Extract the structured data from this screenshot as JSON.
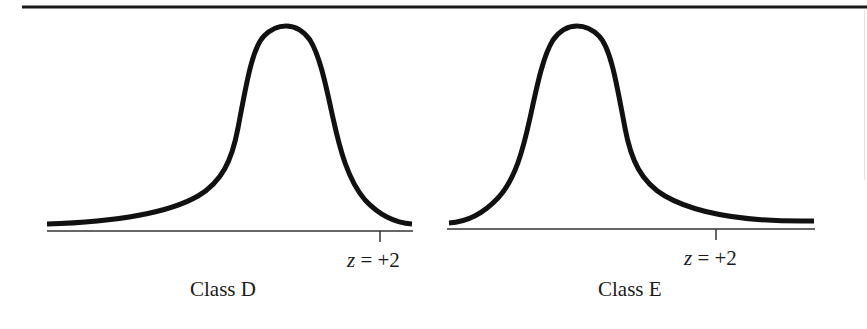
{
  "figure": {
    "top_rule": true,
    "colors": {
      "ink": "#111111",
      "axis": "#333333",
      "background": "#ffffff"
    },
    "panels": [
      {
        "id": "class-d",
        "title": "Class D",
        "z_label_var": "z",
        "z_label_rest": " = +2",
        "skew": "left",
        "curve_path": "M47,224 C110,222 165,215 198,196 C222,182 232,160 238,128 C246,86 252,48 264,36 C272,28 280,26 286,26 C293,26 302,29 310,40 C320,56 326,86 333,118 C340,150 348,180 365,200 C380,216 397,223 412,224",
        "baseline": {
          "x1": 47,
          "x2": 413,
          "y": 231
        },
        "tick": {
          "x": 380,
          "y1": 231,
          "y2": 242
        }
      },
      {
        "id": "class-e",
        "title": "Class E",
        "z_label_var": "z",
        "z_label_rest": " = +2",
        "skew": "right",
        "curve_path": "M449,223 C466,222 483,214 498,198 C515,180 523,150 530,118 C537,86 543,56 553,40 C561,29 570,26 577,26 C583,26 591,28 599,36 C611,48 617,86 625,128 C631,160 641,182 665,196 C698,215 753,222 814,221",
        "baseline": {
          "x1": 447,
          "x2": 815,
          "y": 229
        },
        "tick": {
          "x": 716,
          "y1": 229,
          "y2": 240
        }
      }
    ]
  }
}
